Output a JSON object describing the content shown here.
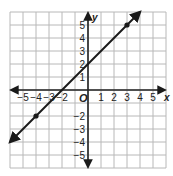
{
  "chart_data": {
    "type": "line",
    "title": "",
    "xlabel": "x",
    "ylabel": "y",
    "origin_label": "O",
    "xlim": [
      -6,
      6
    ],
    "ylim": [
      -6,
      6
    ],
    "grid": true,
    "x_ticks": [
      -5,
      -4,
      -3,
      -2,
      1,
      2,
      3,
      4,
      5
    ],
    "x_tick_labels": [
      "−5",
      "−4",
      "−3",
      "−2",
      "1",
      "2",
      "3",
      "4",
      "5"
    ],
    "y_ticks": [
      5,
      4,
      3,
      2,
      1,
      -2,
      -3,
      -4,
      -5
    ],
    "y_tick_labels": [
      "5",
      "4",
      "3",
      "2",
      "1",
      "−2",
      "−3",
      "−4",
      "−5"
    ],
    "series": [
      {
        "name": "y = x + 2",
        "slope": 1,
        "intercept": 2,
        "x": [
          -6,
          4
        ],
        "y": [
          -4,
          6
        ],
        "arrows_both_ends": true,
        "marked_points": [
          [
            -4,
            -2
          ],
          [
            3,
            5
          ]
        ]
      }
    ]
  },
  "colors": {
    "grid": "#b8b8b8",
    "axis": "#222222",
    "line": "#1a1a1a",
    "background": "#ffffff"
  }
}
